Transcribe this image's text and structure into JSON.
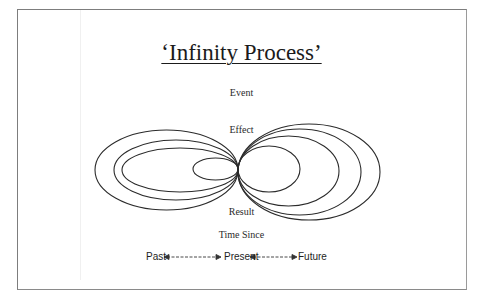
{
  "title": "‘Infinity Process’",
  "labels": {
    "event": "Event",
    "effect": "Effect",
    "result": "Result",
    "time_since": "Time Since"
  },
  "timeline": {
    "past": "Past",
    "present": "Present",
    "future": "Future"
  },
  "colors": {
    "stroke": "#2b2b2b",
    "border": "#7d7d7d",
    "text": "#1b1b1b"
  }
}
